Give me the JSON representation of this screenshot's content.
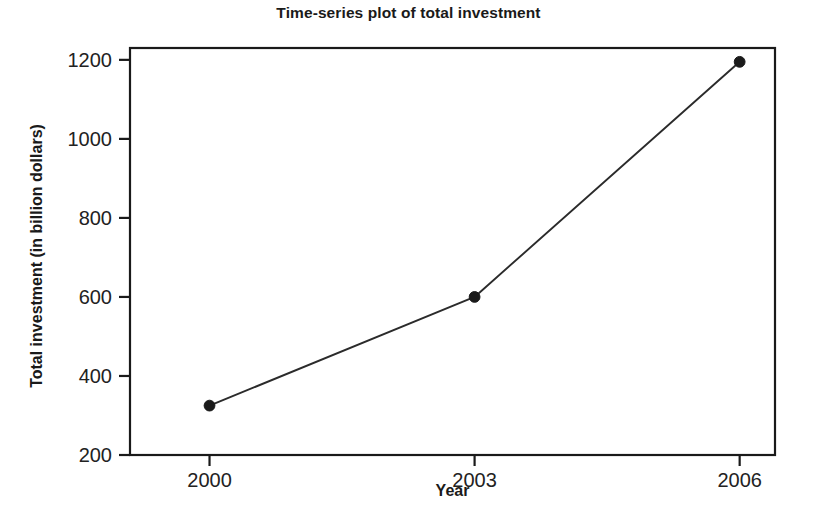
{
  "chart_data": {
    "type": "line",
    "title": "Time-series plot of total investment",
    "xlabel": "Year",
    "ylabel": "Total investment (in billion dollars)",
    "x": [
      2000,
      2003,
      2006
    ],
    "values": [
      325,
      600,
      1195
    ],
    "categories": [
      "2000",
      "2003",
      "2006"
    ],
    "xtick_labels": [
      "2000",
      "2003",
      "2006"
    ],
    "ytick_labels": [
      "200",
      "400",
      "600",
      "800",
      "1000",
      "1200"
    ],
    "yticks": [
      200,
      400,
      600,
      800,
      1000,
      1200
    ],
    "xlim": [
      1999.1,
      2006.4
    ],
    "ylim": [
      200,
      1230
    ],
    "grid": false,
    "legend": false,
    "line_color": "#2b2b2b",
    "marker_color": "#1a1a1a",
    "frame_color": "#1a1a1a",
    "background_color": "#ffffff",
    "points": [
      {
        "label": "2000",
        "x": 2000,
        "y": 325
      },
      {
        "label": "2003",
        "x": 2003,
        "y": 600
      },
      {
        "label": "2006",
        "x": 2006,
        "y": 1195
      }
    ]
  }
}
